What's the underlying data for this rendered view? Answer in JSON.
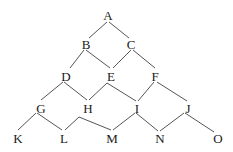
{
  "diagram": {
    "type": "lattice",
    "colors": {
      "line": "#555555",
      "text": "#1a1a1a",
      "background": "#ffffff"
    },
    "nodes": [
      {
        "id": "A",
        "label": "A",
        "x": 108,
        "y": 15
      },
      {
        "id": "B",
        "label": "B",
        "x": 86,
        "y": 44
      },
      {
        "id": "C",
        "label": "C",
        "x": 131,
        "y": 44
      },
      {
        "id": "D",
        "label": "D",
        "x": 66,
        "y": 76
      },
      {
        "id": "E",
        "label": "E",
        "x": 111,
        "y": 76
      },
      {
        "id": "F",
        "label": "F",
        "x": 155,
        "y": 76
      },
      {
        "id": "G",
        "label": "G",
        "x": 41,
        "y": 108
      },
      {
        "id": "H",
        "label": "H",
        "x": 88,
        "y": 108
      },
      {
        "id": "I",
        "label": "I",
        "x": 137,
        "y": 108
      },
      {
        "id": "J",
        "label": "J",
        "x": 188,
        "y": 108
      },
      {
        "id": "K",
        "label": "K",
        "x": 18,
        "y": 138
      },
      {
        "id": "L",
        "label": "L",
        "x": 64,
        "y": 138
      },
      {
        "id": "M",
        "label": "M",
        "x": 112,
        "y": 138
      },
      {
        "id": "N",
        "label": "N",
        "x": 160,
        "y": 138
      },
      {
        "id": "O",
        "label": "O",
        "x": 218,
        "y": 138
      }
    ],
    "edges": [
      {
        "from": "A",
        "to": "B",
        "points": [
          [
            107,
            22
          ],
          [
            89,
            38
          ]
        ]
      },
      {
        "from": "A",
        "to": "C",
        "points": [
          [
            109,
            22
          ],
          [
            129,
            38
          ]
        ]
      },
      {
        "from": "B",
        "to": "D",
        "points": [
          [
            84,
            50
          ],
          [
            70,
            68
          ]
        ]
      },
      {
        "from": "B",
        "to": "E",
        "points": [
          [
            86,
            50
          ],
          [
            110,
            68
          ]
        ]
      },
      {
        "from": "C",
        "to": "E",
        "points": [
          [
            131,
            50
          ],
          [
            113,
            68
          ]
        ]
      },
      {
        "from": "C",
        "to": "F",
        "points": [
          [
            133,
            50
          ],
          [
            155,
            68
          ]
        ]
      },
      {
        "from": "D",
        "to": "G",
        "points": [
          [
            63,
            82
          ],
          [
            41,
            100
          ]
        ]
      },
      {
        "from": "D",
        "to": "H",
        "points": [
          [
            64,
            82
          ],
          [
            87,
            100
          ]
        ]
      },
      {
        "from": "H",
        "to": "I",
        "points": [
          [
            89,
            100
          ],
          [
            107,
            83
          ],
          [
            136,
            101
          ]
        ]
      },
      {
        "from": "F",
        "to": "I",
        "points": [
          [
            154,
            82
          ],
          [
            138,
            101
          ]
        ]
      },
      {
        "from": "F",
        "to": "J",
        "points": [
          [
            157,
            82
          ],
          [
            187,
            101
          ]
        ]
      },
      {
        "from": "G",
        "to": "K",
        "points": [
          [
            36,
            113
          ],
          [
            18,
            130
          ]
        ]
      },
      {
        "from": "G",
        "to": "L",
        "points": [
          [
            37,
            113
          ],
          [
            62,
            130
          ]
        ]
      },
      {
        "from": "L",
        "to": "M",
        "points": [
          [
            65,
            130
          ],
          [
            79,
            117
          ],
          [
            111,
            130
          ]
        ]
      },
      {
        "from": "M",
        "to": "I",
        "points": [
          [
            113,
            130
          ],
          [
            135,
            113
          ]
        ]
      },
      {
        "from": "I",
        "to": "N",
        "points": [
          [
            136,
            113
          ],
          [
            158,
            131
          ]
        ]
      },
      {
        "from": "N",
        "to": "J",
        "points": [
          [
            160,
            131
          ],
          [
            184,
            113
          ]
        ]
      },
      {
        "from": "J",
        "to": "O",
        "points": [
          [
            185,
            113
          ],
          [
            214,
            132
          ]
        ]
      }
    ]
  }
}
